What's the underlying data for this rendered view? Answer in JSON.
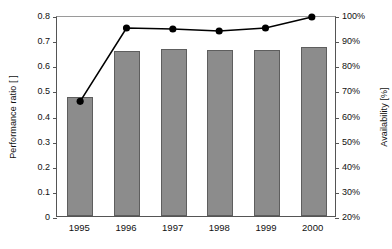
{
  "chart_data": {
    "type": "bar",
    "title": "",
    "categories": [
      "1995",
      "1996",
      "1997",
      "1998",
      "1999",
      "2000"
    ],
    "xlabel": "",
    "ylabel": "Performance ratio [ ]",
    "ylabel_right": "Availability [%]",
    "ylim": [
      0,
      0.8
    ],
    "ylim_right": [
      20,
      100
    ],
    "grid": false,
    "legend": null,
    "yticks": [
      "0",
      "0.1",
      "0.2",
      "0.3",
      "0.4",
      "0.5",
      "0.6",
      "0.7",
      "0.8"
    ],
    "ytick_values": [
      0,
      0.1,
      0.2,
      0.3,
      0.4,
      0.5,
      0.6,
      0.7,
      0.8
    ],
    "yticks_right": [
      "20%",
      "30%",
      "40%",
      "50%",
      "60%",
      "70%",
      "80%",
      "90%",
      "100%"
    ],
    "ytick_values_right": [
      20,
      30,
      40,
      50,
      60,
      70,
      80,
      90,
      100
    ],
    "series": [
      {
        "name": "Performance ratio",
        "type": "bar",
        "axis": "left",
        "color": "#8c8c8c",
        "edge_color": "#5e5e5e",
        "values": [
          0.474,
          0.657,
          0.665,
          0.661,
          0.661,
          0.673
        ]
      },
      {
        "name": "Availability",
        "type": "line",
        "axis": "right",
        "color": "#000000",
        "marker": "circle",
        "values": [
          66.2,
          95.6,
          95.2,
          94.4,
          95.6,
          100.0
        ]
      }
    ]
  },
  "colors": {
    "bar_fill": "#8c8c8c",
    "bar_edge": "#5e5e5e",
    "line": "#000000",
    "axis": "#555555",
    "background": "#ffffff"
  }
}
